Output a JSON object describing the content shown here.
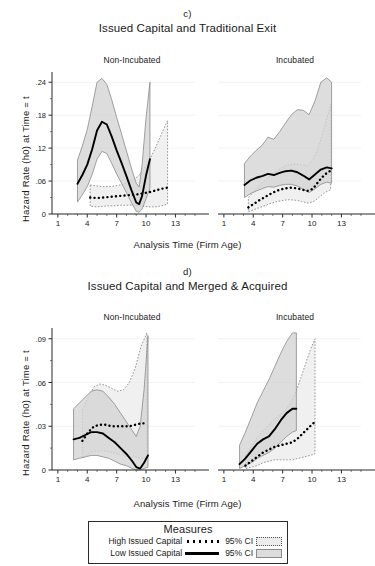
{
  "figure": {
    "background": "#ffffff",
    "width": 375,
    "height": 566
  },
  "panels": [
    {
      "letter": "c)",
      "title": "Issued Capital and Traditional Exit",
      "ylabel": "Hazard Rate (h0) at Time = t",
      "xlabel": "Analysis Time (Firm Age)",
      "subpanels": [
        {
          "label": "Non-Incubated"
        },
        {
          "label": "Incubated"
        }
      ]
    },
    {
      "letter": "d)",
      "title": "Issued Capital and Merged & Acquired",
      "ylabel": "Hazard Rate (h0) at Time = t",
      "xlabel": "Analysis Time (Firm Age)",
      "subpanels": [
        {
          "label": "Non-Incubated"
        },
        {
          "label": "Incubated"
        }
      ]
    }
  ],
  "legend": {
    "title": "Measures",
    "rows": [
      {
        "series": "High Issued Capital",
        "ci": "95% CI"
      },
      {
        "series": "Low Issued Capital",
        "ci": "95% CI"
      }
    ]
  },
  "colors": {
    "line": "#000000",
    "ci_fill_light": "#ececec",
    "ci_fill_dark": "#d4d4d4",
    "ci_edge": "#8a8a8a",
    "axis": "#2b2b2b",
    "grid": "#f2f2f2",
    "text": "#1a1a1a"
  },
  "chart_data": [
    {
      "type": "line",
      "id": "c-non-incubated",
      "title": "Issued Capital and Traditional Exit",
      "panel_letter": "c)",
      "subpanel": "Non-Incubated",
      "xlabel": "Analysis Time (Firm Age)",
      "ylabel": "Hazard Rate (h0) at Time = t",
      "xlim": [
        0.4,
        15.0
      ],
      "ylim": [
        0.0,
        0.255
      ],
      "xticks": [
        1,
        4,
        7,
        10,
        13
      ],
      "yticks": [
        0,
        0.06,
        0.12,
        0.18,
        0.24
      ],
      "ytick_labels": [
        "0",
        ".06",
        ".12",
        ".18",
        ".24"
      ],
      "grid": true,
      "legend_position": "below-figure",
      "series": [
        {
          "name": "Low Issued Capital",
          "style": "solid",
          "x": [
            3.0,
            3.5,
            4.0,
            4.5,
            5.0,
            5.5,
            6.0,
            6.5,
            7.0,
            7.5,
            8.0,
            8.5,
            9.0,
            9.3,
            9.6,
            10.0,
            10.4
          ],
          "y": [
            0.055,
            0.071,
            0.09,
            0.118,
            0.152,
            0.168,
            0.163,
            0.141,
            0.116,
            0.093,
            0.069,
            0.044,
            0.021,
            0.018,
            0.033,
            0.07,
            0.1
          ],
          "ci_lower": [
            0.022,
            0.035,
            0.05,
            0.072,
            0.1,
            0.114,
            0.11,
            0.092,
            0.073,
            0.056,
            0.039,
            0.021,
            0.005,
            0.003,
            0.009,
            0.028,
            0.047
          ],
          "ci_upper": [
            0.098,
            0.124,
            0.154,
            0.196,
            0.24,
            0.247,
            0.236,
            0.208,
            0.176,
            0.146,
            0.115,
            0.084,
            0.056,
            0.049,
            0.09,
            0.175,
            0.24
          ]
        },
        {
          "name": "High Issued Capital",
          "style": "dotted",
          "x": [
            4.3,
            5.0,
            5.6,
            6.2,
            6.8,
            7.4,
            8.0,
            8.6,
            9.2,
            9.8,
            10.4,
            11.0,
            11.6,
            12.2
          ],
          "y": [
            0.03,
            0.029,
            0.03,
            0.031,
            0.032,
            0.033,
            0.034,
            0.035,
            0.036,
            0.038,
            0.04,
            0.043,
            0.046,
            0.048
          ],
          "ci_lower": [
            0.014,
            0.013,
            0.014,
            0.015,
            0.015,
            0.016,
            0.016,
            0.016,
            0.015,
            0.014,
            0.013,
            0.013,
            0.015,
            0.018
          ],
          "ci_upper": [
            0.053,
            0.051,
            0.05,
            0.05,
            0.051,
            0.053,
            0.056,
            0.061,
            0.069,
            0.082,
            0.1,
            0.122,
            0.147,
            0.17
          ]
        }
      ]
    },
    {
      "type": "line",
      "id": "c-incubated",
      "title": "Issued Capital and Traditional Exit",
      "panel_letter": "c)",
      "subpanel": "Incubated",
      "xlabel": "Analysis Time (Firm Age)",
      "ylabel": "Hazard Rate (h0) at Time = t",
      "xlim": [
        0.4,
        15.0
      ],
      "ylim": [
        0.0,
        0.255
      ],
      "xticks": [
        1,
        4,
        7,
        10,
        13
      ],
      "yticks": [
        0,
        0.06,
        0.12,
        0.18,
        0.24
      ],
      "ytick_labels": [
        "0",
        ".06",
        ".12",
        ".18",
        ".24"
      ],
      "grid": true,
      "series": [
        {
          "name": "Low Issued Capital",
          "style": "solid",
          "x": [
            3.1,
            3.7,
            4.3,
            4.9,
            5.5,
            6.1,
            6.7,
            7.3,
            7.9,
            8.5,
            9.1,
            9.7,
            10.3,
            10.9,
            11.5,
            12.0
          ],
          "y": [
            0.053,
            0.061,
            0.066,
            0.069,
            0.073,
            0.071,
            0.075,
            0.078,
            0.079,
            0.076,
            0.07,
            0.063,
            0.072,
            0.081,
            0.085,
            0.083
          ],
          "ci_lower": [
            0.03,
            0.037,
            0.042,
            0.046,
            0.05,
            0.049,
            0.052,
            0.054,
            0.054,
            0.051,
            0.045,
            0.039,
            0.046,
            0.054,
            0.058,
            0.056
          ],
          "ci_upper": [
            0.092,
            0.105,
            0.116,
            0.125,
            0.14,
            0.136,
            0.15,
            0.166,
            0.181,
            0.19,
            0.189,
            0.181,
            0.206,
            0.24,
            0.248,
            0.24
          ]
        },
        {
          "name": "High Issued Capital",
          "style": "dotted",
          "x": [
            3.5,
            4.1,
            4.7,
            5.3,
            5.9,
            6.5,
            7.1,
            7.7,
            8.3,
            8.9,
            9.5,
            10.1,
            10.7,
            11.3,
            11.9
          ],
          "y": [
            0.012,
            0.019,
            0.026,
            0.032,
            0.038,
            0.043,
            0.046,
            0.048,
            0.047,
            0.045,
            0.042,
            0.046,
            0.06,
            0.072,
            0.079
          ],
          "ci_lower": [
            0.004,
            0.008,
            0.012,
            0.016,
            0.02,
            0.023,
            0.025,
            0.026,
            0.025,
            0.023,
            0.02,
            0.022,
            0.03,
            0.039,
            0.044
          ],
          "ci_upper": [
            0.03,
            0.042,
            0.053,
            0.063,
            0.072,
            0.08,
            0.086,
            0.09,
            0.091,
            0.09,
            0.088,
            0.098,
            0.124,
            0.16,
            0.2
          ]
        }
      ]
    },
    {
      "type": "line",
      "id": "d-non-incubated",
      "title": "Issued Capital and Merged & Acquired",
      "panel_letter": "d)",
      "subpanel": "Non-Incubated",
      "xlabel": "Analysis Time (Firm Age)",
      "ylabel": "Hazard Rate (h0) at Time = t",
      "xlim": [
        0.4,
        15.0
      ],
      "ylim": [
        0.0,
        0.096
      ],
      "xticks": [
        1,
        4,
        7,
        10,
        13
      ],
      "yticks": [
        0,
        0.03,
        0.06,
        0.09
      ],
      "ytick_labels": [
        "0",
        ".03",
        ".06",
        ".09"
      ],
      "grid": true,
      "series": [
        {
          "name": "Low Issued Capital",
          "style": "solid",
          "x": [
            2.6,
            3.2,
            3.8,
            4.4,
            5.0,
            5.6,
            6.2,
            6.8,
            7.4,
            8.0,
            8.6,
            9.0,
            9.4,
            9.8,
            10.2
          ],
          "y": [
            0.021,
            0.022,
            0.024,
            0.026,
            0.026,
            0.025,
            0.022,
            0.019,
            0.015,
            0.011,
            0.006,
            0.002,
            0.001,
            0.005,
            0.01
          ],
          "ci_lower": [
            0.007,
            0.008,
            0.009,
            0.01,
            0.01,
            0.009,
            0.008,
            0.006,
            0.004,
            0.003,
            0.001,
            0.0,
            0.0,
            0.001,
            0.002
          ],
          "ci_upper": [
            0.042,
            0.046,
            0.05,
            0.054,
            0.055,
            0.054,
            0.05,
            0.045,
            0.039,
            0.033,
            0.027,
            0.023,
            0.03,
            0.055,
            0.092
          ]
        },
        {
          "name": "High Issued Capital",
          "style": "dotted",
          "x": [
            3.5,
            4.1,
            4.7,
            5.3,
            5.9,
            6.5,
            7.1,
            7.7,
            8.3,
            8.9,
            9.5,
            10.1
          ],
          "y": [
            0.02,
            0.026,
            0.03,
            0.031,
            0.031,
            0.03,
            0.03,
            0.03,
            0.03,
            0.031,
            0.032,
            0.032
          ],
          "ci_lower": [
            0.008,
            0.011,
            0.013,
            0.013,
            0.013,
            0.012,
            0.011,
            0.01,
            0.009,
            0.009,
            0.008,
            0.008
          ],
          "ci_upper": [
            0.041,
            0.05,
            0.057,
            0.059,
            0.058,
            0.056,
            0.054,
            0.055,
            0.06,
            0.07,
            0.085,
            0.094
          ]
        }
      ]
    },
    {
      "type": "line",
      "id": "d-incubated",
      "title": "Issued Capital and Merged & Acquired",
      "panel_letter": "d)",
      "subpanel": "Incubated",
      "xlabel": "Analysis Time (Firm Age)",
      "ylabel": "Hazard Rate (h0) at Time = t",
      "xlim": [
        0.4,
        15.0
      ],
      "ylim": [
        0.0,
        0.096
      ],
      "xticks": [
        1,
        4,
        7,
        10,
        13
      ],
      "yticks": [
        0,
        0.03,
        0.06,
        0.09
      ],
      "ytick_labels": [
        "0",
        ".03",
        ".06",
        ".09"
      ],
      "grid": true,
      "series": [
        {
          "name": "Low Issued Capital",
          "style": "solid",
          "x": [
            2.6,
            3.2,
            3.8,
            4.4,
            5.0,
            5.6,
            6.2,
            6.8,
            7.4,
            8.0,
            8.4
          ],
          "y": [
            0.004,
            0.008,
            0.013,
            0.018,
            0.021,
            0.023,
            0.028,
            0.034,
            0.039,
            0.042,
            0.042
          ],
          "ci_lower": [
            0.001,
            0.003,
            0.005,
            0.008,
            0.01,
            0.012,
            0.015,
            0.019,
            0.023,
            0.026,
            0.027
          ],
          "ci_upper": [
            0.017,
            0.026,
            0.036,
            0.046,
            0.054,
            0.062,
            0.071,
            0.08,
            0.088,
            0.094,
            0.094
          ]
        },
        {
          "name": "High Issued Capital",
          "style": "dotted",
          "x": [
            3.2,
            3.8,
            4.4,
            5.0,
            5.6,
            6.2,
            6.8,
            7.4,
            8.0,
            8.6,
            9.2,
            9.8,
            10.3
          ],
          "y": [
            0.003,
            0.006,
            0.009,
            0.012,
            0.014,
            0.016,
            0.017,
            0.018,
            0.019,
            0.022,
            0.026,
            0.03,
            0.033
          ],
          "ci_lower": [
            0.001,
            0.002,
            0.003,
            0.005,
            0.006,
            0.007,
            0.007,
            0.007,
            0.007,
            0.008,
            0.009,
            0.01,
            0.011
          ],
          "ci_upper": [
            0.01,
            0.016,
            0.022,
            0.027,
            0.031,
            0.035,
            0.038,
            0.042,
            0.048,
            0.058,
            0.07,
            0.082,
            0.09
          ]
        }
      ]
    }
  ]
}
